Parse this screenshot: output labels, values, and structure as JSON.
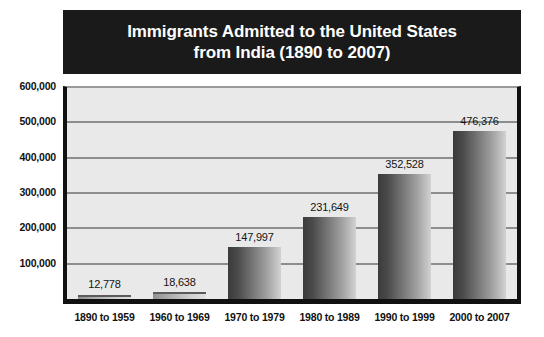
{
  "chart_data": {
    "type": "bar",
    "title": "Immigrants Admitted to the United States from India (1890 to 2007)",
    "title_lines": [
      "Immigrants Admitted to the United States",
      "from India (1890 to 2007)"
    ],
    "xlabel": "",
    "ylabel": "",
    "ylim": [
      0,
      600000
    ],
    "ytick_step": 100000,
    "grid": true,
    "legend": "none",
    "categories": [
      "1890 to 1959",
      "1960 to 1969",
      "1970 to 1979",
      "1980 to 1989",
      "1990 to 1999",
      "2000 to 2007"
    ],
    "values": [
      12778,
      18638,
      147997,
      231649,
      352528,
      476376
    ],
    "value_labels": [
      "12,778",
      "18,638",
      "147,997",
      "231,649",
      "352,528",
      "476,376"
    ],
    "ytick_labels": [
      "600,000",
      "500,000",
      "400,000",
      "300,000",
      "200,000",
      "100,000"
    ],
    "ytick_values": [
      600000,
      500000,
      400000,
      300000,
      200000,
      100000
    ]
  },
  "style": {
    "title_bg": "#1a1a1a",
    "title_color": "#ffffff",
    "plot_bg": "#e9e9e9",
    "axis_color": "#111111",
    "gridline_color": "#8d8d8d",
    "bar_dark": "#3b3b3b",
    "bar_light": "#d2d2d2",
    "page_bg": "#ffffff"
  }
}
